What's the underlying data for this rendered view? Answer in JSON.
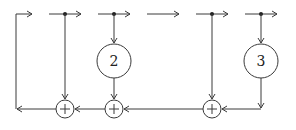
{
  "diagram": {
    "type": "signal-flow / convolutional encoder",
    "colors": {
      "stroke": "#3a3a3a",
      "background": "#ffffff"
    },
    "gain_nodes": [
      {
        "label": "2",
        "cx": 114,
        "cy": 61
      },
      {
        "label": "3",
        "cx": 261,
        "cy": 61
      }
    ],
    "adders": [
      {
        "symbol": "+",
        "cx": 65,
        "cy": 109
      },
      {
        "symbol": "+",
        "cx": 114,
        "cy": 109
      },
      {
        "symbol": "+",
        "cx": 212,
        "cy": 109
      }
    ],
    "top_arrows": 6,
    "tap_points": [
      65,
      114,
      212,
      261
    ]
  }
}
